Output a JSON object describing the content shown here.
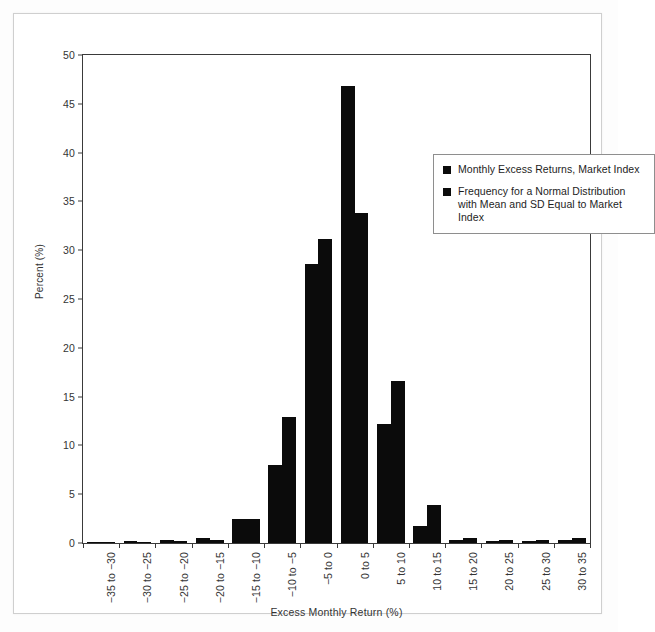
{
  "chart_data": {
    "type": "bar",
    "title": "",
    "xlabel": "Excess Monthly Return (%)",
    "ylabel": "Percent (%)",
    "ylim": [
      0,
      50
    ],
    "ytick_step": 5,
    "yticks": [
      "0",
      "5",
      "10",
      "15",
      "20",
      "25",
      "30",
      "35",
      "40",
      "45",
      "50"
    ],
    "grid": false,
    "legend_position": "upper-right-inside",
    "categories": [
      "−35 to −30",
      "−30 to −25",
      "−25 to −20",
      "−20 to −15",
      "−15 to −10",
      "−10 to −5",
      "−5 to 0",
      "0 to 5",
      "5 to 10",
      "10 to 15",
      "15 to 20",
      "20 to 25",
      "25 to 30",
      "30 to 35"
    ],
    "series": [
      {
        "name": "Monthly Excess Returns, Market Index",
        "color": "#0b0b0b",
        "values": [
          0.1,
          0.2,
          0.3,
          0.5,
          2.5,
          8.0,
          28.6,
          46.8,
          12.2,
          1.7,
          0.3,
          0.2,
          0.2,
          0.3
        ]
      },
      {
        "name": "Frequency for a Normal Distribution with Mean and SD Equal to Market Index",
        "color": "#0b0b0b",
        "values": [
          0.05,
          0.1,
          0.2,
          0.3,
          2.5,
          12.9,
          31.1,
          33.8,
          16.6,
          3.9,
          0.5,
          0.3,
          0.3,
          0.5
        ]
      }
    ]
  },
  "legend": {
    "items": [
      {
        "label": "Monthly Excess Returns, Market Index"
      },
      {
        "label": "Frequency for a Normal Distribution with Mean and SD Equal to Market Index"
      }
    ]
  },
  "axes": {
    "y_title": "Percent (%)",
    "x_title": "Excess Monthly Return (%)"
  }
}
